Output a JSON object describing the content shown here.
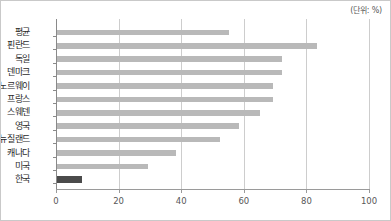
{
  "chart_data": {
    "type": "bar",
    "orientation": "horizontal",
    "title": "",
    "subtitle": "",
    "unit_label": "(단위: %)",
    "xlabel": "",
    "ylabel": "",
    "xlim": [
      0,
      100
    ],
    "xticks": [
      0,
      20,
      40,
      60,
      80,
      100
    ],
    "xtick_labels": [
      "0",
      "20",
      "40",
      "60",
      "80",
      "100"
    ],
    "grid": true,
    "grid_axis": "x",
    "legend": false,
    "categories": [
      "평균",
      "핀란드",
      "독일",
      "덴마크",
      "노르웨이",
      "프랑스",
      "스웨덴",
      "영국",
      "뉴질랜드",
      "캐나다",
      "미국",
      "한국"
    ],
    "values": [
      55,
      83,
      72,
      72,
      69,
      69,
      65,
      58,
      52,
      38,
      29,
      8
    ],
    "series": [
      {
        "name": "비율",
        "values": [
          55,
          83,
          72,
          72,
          69,
          69,
          65,
          58,
          52,
          38,
          29,
          8
        ]
      }
    ],
    "bars": [
      {
        "label": "평균",
        "value": 55,
        "highlight": false
      },
      {
        "label": "핀란드",
        "value": 83,
        "highlight": false
      },
      {
        "label": "독일",
        "value": 72,
        "highlight": false
      },
      {
        "label": "덴마크",
        "value": 72,
        "highlight": false
      },
      {
        "label": "노르웨이",
        "value": 69,
        "highlight": false
      },
      {
        "label": "프랑스",
        "value": 69,
        "highlight": false
      },
      {
        "label": "스웨덴",
        "value": 65,
        "highlight": false
      },
      {
        "label": "영국",
        "value": 58,
        "highlight": false
      },
      {
        "label": "뉴질랜드",
        "value": 52,
        "highlight": false
      },
      {
        "label": "캐나다",
        "value": 38,
        "highlight": false
      },
      {
        "label": "미국",
        "value": 29,
        "highlight": false
      },
      {
        "label": "한국",
        "value": 8,
        "highlight": true
      }
    ],
    "colors": {
      "bar": "#b9b9b9",
      "bar_highlight": "#4b4b4b",
      "gridline": "#cdcdcd",
      "axis": "#8a8a8a",
      "text": "#2b2b2b",
      "tick_text": "#585858",
      "frame_border": "#c9c9c9",
      "background": "#ffffff"
    }
  }
}
